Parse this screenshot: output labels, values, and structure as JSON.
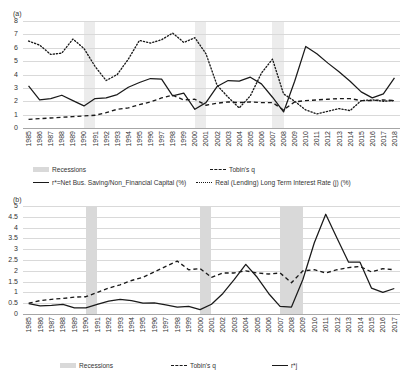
{
  "figure": {
    "panel_a_label": "(a)",
    "panel_b_label": "(b)"
  },
  "legend_a": {
    "recessions": "Recessions",
    "tobins_q": "Tobin's q",
    "r_star": "r*=Net Bus. Saving/Non_Financial Capital (%)",
    "real_rate": "Real (Lending) Long Term Interest Rate (j)  (%)"
  },
  "legend_b": {
    "recessions": "Recessions",
    "tobins_q": "Tobin's q",
    "r_star_j": "r*j"
  },
  "colors": {
    "line": "#1a1a1a",
    "band": "#d9d9d9",
    "band_light": "#ececec",
    "grid": "#d9d9d9",
    "axis": "#a6a6a6",
    "text": "#333333"
  },
  "chart_data": [
    {
      "type": "line",
      "title": "(a)",
      "xlabel": "",
      "ylabel": "",
      "ylim": [
        0,
        8
      ],
      "yticks": [
        0,
        1,
        2,
        3,
        4,
        5,
        6,
        7,
        8
      ],
      "ytick_labels": [
        "0",
        "1",
        "2",
        "3",
        "4",
        "5",
        "6",
        "7",
        "8"
      ],
      "grid": true,
      "legend_position": "bottom",
      "x": [
        1985,
        1986,
        1987,
        1988,
        1989,
        1990,
        1991,
        1992,
        1993,
        1994,
        1995,
        1996,
        1997,
        1998,
        1999,
        2000,
        2001,
        2002,
        2003,
        2004,
        2005,
        2006,
        2007,
        2008,
        2009,
        2010,
        2011,
        2012,
        2013,
        2014,
        2015,
        2016,
        2017,
        2018
      ],
      "xtick_labels": [
        "1985",
        "1986",
        "1987",
        "1988",
        "1989",
        "1990",
        "1991",
        "1992",
        "1993",
        "1994",
        "1995",
        "1996",
        "1997",
        "1998",
        "1999",
        "2000",
        "2001",
        "2002",
        "2003",
        "2004",
        "2005",
        "2006",
        "2007",
        "2008",
        "2009",
        "2010",
        "2011",
        "2012",
        "2013",
        "2014",
        "2015",
        "2016",
        "2017",
        "2018"
      ],
      "recessions": [
        [
          1990,
          1991
        ],
        [
          2000,
          2001
        ],
        [
          2007,
          2008
        ]
      ],
      "series": [
        {
          "name": "r*=Net Bus. Saving/Non_Financial Capital (%)",
          "style": "solid",
          "values": [
            3.15,
            2.1,
            2.2,
            2.45,
            2.05,
            1.65,
            2.2,
            2.25,
            2.5,
            3.05,
            3.4,
            3.7,
            3.65,
            2.4,
            2.6,
            1.4,
            1.9,
            3.1,
            3.55,
            3.5,
            3.8,
            3.3,
            2.3,
            1.2,
            3.5,
            6.1,
            5.55,
            4.85,
            4.2,
            3.5,
            2.7,
            2.25,
            2.55,
            3.75
          ]
        },
        {
          "name": "Tobin's q",
          "style": "dashed",
          "values": [
            0.65,
            0.7,
            0.75,
            0.8,
            0.85,
            0.9,
            0.95,
            1.15,
            1.4,
            1.5,
            1.75,
            1.95,
            2.25,
            2.45,
            2.1,
            2.15,
            1.7,
            1.85,
            1.95,
            1.9,
            1.95,
            1.9,
            1.9,
            1.35,
            1.95,
            2.05,
            2.1,
            2.15,
            2.2,
            2.2,
            2.05,
            2.05,
            2.1,
            2.05
          ]
        },
        {
          "name": "Real (Lending) Long Term Interest Rate (j)  (%)",
          "style": "dotted",
          "values": [
            6.5,
            6.2,
            5.5,
            5.6,
            6.65,
            5.95,
            4.6,
            3.55,
            4.0,
            5.15,
            6.55,
            6.35,
            6.6,
            7.1,
            6.4,
            6.75,
            5.55,
            3.2,
            2.3,
            1.5,
            2.4,
            4.1,
            5.15,
            2.55,
            2.0,
            1.35,
            1.05,
            1.25,
            1.45,
            1.3,
            2.05,
            2.1,
            2.0,
            2.05
          ]
        }
      ]
    },
    {
      "type": "line",
      "title": "(b)",
      "xlabel": "",
      "ylabel": "",
      "ylim": [
        0,
        5
      ],
      "yticks": [
        0,
        0.5,
        1,
        1.5,
        2,
        2.5,
        3,
        3.5,
        4,
        4.5,
        5
      ],
      "ytick_labels": [
        "0",
        "0.5",
        "1",
        "1.5",
        "2",
        "2.5",
        "3",
        "3.5",
        "4",
        "4.5",
        "5"
      ],
      "grid": true,
      "legend_position": "bottom",
      "x": [
        1985,
        1986,
        1987,
        1988,
        1989,
        1990,
        1991,
        1992,
        1993,
        1994,
        1995,
        1996,
        1997,
        1998,
        1999,
        2000,
        2001,
        2002,
        2003,
        2004,
        2005,
        2006,
        2007,
        2008,
        2009,
        2010,
        2011,
        2012,
        2013,
        2014,
        2015,
        2016,
        2017
      ],
      "xtick_labels": [
        "1985",
        "1986",
        "1987",
        "1988",
        "1989",
        "1990",
        "1991",
        "1992",
        "1993",
        "1994",
        "1995",
        "1996",
        "1997",
        "1998",
        "1999",
        "2000",
        "2001",
        "2002",
        "2003",
        "2004",
        "2005",
        "2006",
        "2007",
        "2008",
        "2009",
        "2010",
        "2011",
        "2012",
        "2013",
        "2014",
        "2015",
        "2016",
        "2017"
      ],
      "recessions": [
        [
          1990,
          1991
        ],
        [
          2000,
          2001
        ],
        [
          2007,
          2009
        ]
      ],
      "series": [
        {
          "name": "Tobin's q",
          "style": "dashed",
          "values": [
            0.5,
            0.62,
            0.68,
            0.72,
            0.78,
            0.8,
            1.0,
            1.2,
            1.35,
            1.55,
            1.7,
            1.95,
            2.2,
            2.45,
            2.05,
            2.1,
            1.7,
            1.9,
            1.9,
            2.0,
            1.9,
            1.85,
            1.9,
            1.45,
            2.0,
            2.05,
            1.9,
            2.05,
            2.15,
            2.2,
            1.95,
            2.1,
            2.05
          ]
        },
        {
          "name": "r*j",
          "style": "solid",
          "values": [
            0.48,
            0.38,
            0.4,
            0.45,
            0.28,
            0.28,
            0.45,
            0.6,
            0.68,
            0.62,
            0.5,
            0.52,
            0.42,
            0.32,
            0.35,
            0.2,
            0.45,
            0.95,
            1.6,
            2.3,
            1.7,
            0.95,
            0.35,
            0.32,
            1.6,
            3.3,
            4.62,
            3.5,
            2.4,
            2.4,
            1.2,
            1.0,
            1.18
          ]
        }
      ]
    }
  ]
}
